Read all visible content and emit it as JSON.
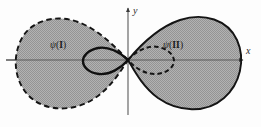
{
  "figure": {
    "name": "two-lobe-wavefunction-diagram",
    "background_color": "#fdfdfd",
    "fill_color": "#a9a9a9",
    "stroke_color": "#1a1a1a",
    "axis_color": "#555555",
    "width": 261,
    "height": 127
  },
  "axes": {
    "x_label": "x",
    "y_label": "y",
    "origin_x": 128,
    "origin_y": 60,
    "x_axis_start": 6,
    "x_axis_end": 243,
    "y_axis_top": 8,
    "y_axis_bottom": 115
  },
  "regions": [
    {
      "id": "left",
      "psi": "ψ",
      "open_paren": "(",
      "numeral": "I",
      "close_paren": ")",
      "outline_style": "dashed",
      "fill": "gray"
    },
    {
      "id": "right",
      "psi": "ψ",
      "open_paren": "(",
      "numeral": "II",
      "close_paren": ")",
      "outline_style": "solid",
      "fill": "gray"
    }
  ],
  "inner_loops": [
    {
      "id": "inner-left",
      "outline_style": "solid"
    },
    {
      "id": "inner-right",
      "outline_style": "dashed"
    }
  ]
}
